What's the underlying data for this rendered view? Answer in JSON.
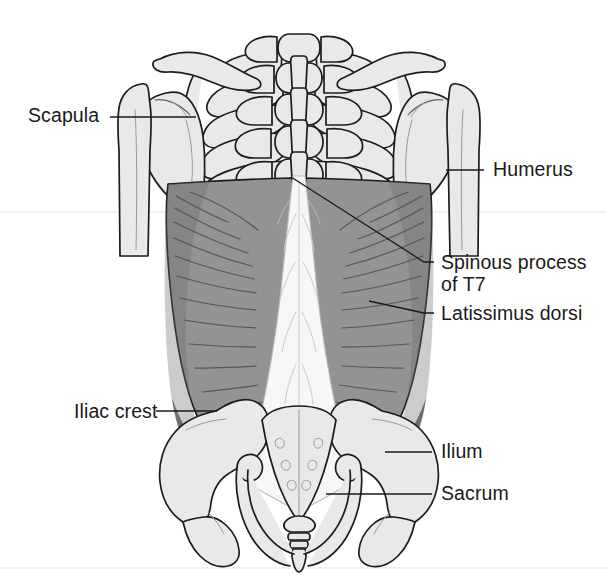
{
  "figure": {
    "domain_kind": "anatomical-illustration",
    "background_color": "#ffffff",
    "palette": {
      "bone_fill": "#e9e9e9",
      "bone_outline": "#1c1c1c",
      "muscle_fill": "#939393",
      "muscle_shadow": "#6e6e6e",
      "fascia_fill": "#f7f7f7",
      "label_color": "#1a1a1a",
      "leader_color": "#1a1a1a"
    }
  },
  "labels": [
    {
      "id": "scapula",
      "text": "Scapula",
      "side": "left",
      "text_x": 28,
      "text_y": 122,
      "leader": "M110,117 L196,117"
    },
    {
      "id": "humerus",
      "text": "Humerus",
      "side": "right",
      "text_x": 493,
      "text_y": 176,
      "leader": "M446,170 L484,170"
    },
    {
      "id": "spinous-process-t7",
      "text": "Spinous process",
      "text_line2": "of T7",
      "side": "right",
      "text_x": 441,
      "text_y": 269,
      "text2_x": 441,
      "text2_y": 291,
      "leader": "M291,177 L424,262 L434,262"
    },
    {
      "id": "latissimus-dorsi",
      "text": "Latissimus dorsi",
      "side": "right",
      "text_x": 441,
      "text_y": 320,
      "leader": "M369,301 L424,313 L434,313"
    },
    {
      "id": "iliac-crest",
      "text": "Iliac crest",
      "side": "left",
      "text_x": 74,
      "text_y": 418,
      "leader": "M156,411 L217,411"
    },
    {
      "id": "ilium",
      "text": "Ilium",
      "side": "right",
      "text_x": 441,
      "text_y": 458,
      "leader": "M385,452 L432,452"
    },
    {
      "id": "sacrum",
      "text": "Sacrum",
      "side": "right",
      "text_x": 441,
      "text_y": 500,
      "leader": "M326,494 L432,494"
    }
  ],
  "structures": [
    {
      "id": "spine-thoracic",
      "name": "thoracic vertebrae and ribs"
    },
    {
      "id": "scapula-left",
      "name": "left scapula"
    },
    {
      "id": "scapula-right",
      "name": "right scapula"
    },
    {
      "id": "humerus-left",
      "name": "left humerus"
    },
    {
      "id": "humerus-right",
      "name": "right humerus"
    },
    {
      "id": "latissimus-dorsi-left",
      "name": "left latissimus dorsi"
    },
    {
      "id": "latissimus-dorsi-right",
      "name": "right latissimus dorsi"
    },
    {
      "id": "thoracolumbar-fascia",
      "name": "thoracolumbar fascia"
    },
    {
      "id": "ilium-left",
      "name": "left ilium"
    },
    {
      "id": "ilium-right",
      "name": "right ilium"
    },
    {
      "id": "sacrum-bone",
      "name": "sacrum"
    },
    {
      "id": "coccyx",
      "name": "coccyx"
    }
  ]
}
